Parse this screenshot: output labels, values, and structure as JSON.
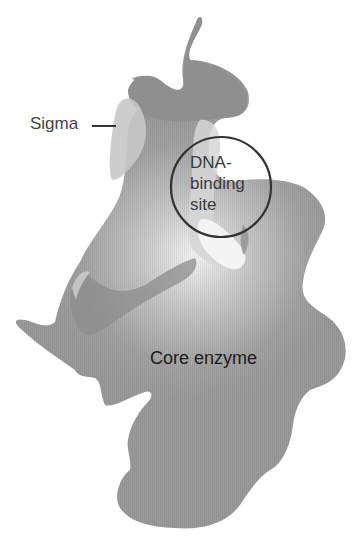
{
  "diagram": {
    "type": "RNA polymerase holoenzyme schematic",
    "labels": {
      "sigma": "Sigma",
      "dna_binding_site": [
        "DNA-",
        "binding",
        "site"
      ],
      "core_enzyme": "Core enzyme"
    },
    "colors": {
      "core_enzyme_fill": "#999999",
      "sigma_fill": "#c4c4c4",
      "sigma_dark_fill": "#8a8a8a",
      "highlight_center": "#f2f2f2",
      "circle_stroke": "#333333",
      "text": "#333333"
    }
  }
}
